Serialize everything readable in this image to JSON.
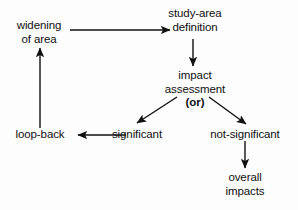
{
  "diagram": {
    "stroke_color": "#101010",
    "background_color": "#fdfdfd",
    "nodes": [
      {
        "id": "widening",
        "lines": [
          "widening",
          "of area"
        ]
      },
      {
        "id": "study_area",
        "lines": [
          "study-area",
          "definition"
        ]
      },
      {
        "id": "impact",
        "lines": [
          "impact",
          "assessment",
          "(or)"
        ]
      },
      {
        "id": "loop_back",
        "lines": [
          "loop-back"
        ]
      },
      {
        "id": "significant",
        "lines": [
          "significant"
        ]
      },
      {
        "id": "not_significant",
        "lines": [
          "not-significant"
        ]
      },
      {
        "id": "overall",
        "lines": [
          "overall",
          "impacts"
        ]
      }
    ],
    "edges": [
      {
        "id": "widening-to-study-area",
        "from": "widening",
        "to": "study_area",
        "kind": "horizontal-right"
      },
      {
        "id": "study-area-to-impact",
        "from": "study_area",
        "to": "impact",
        "kind": "vertical-down"
      },
      {
        "id": "impact-to-significant",
        "from": "impact",
        "to": "significant",
        "kind": "diagonal-down-left"
      },
      {
        "id": "impact-to-not-significant",
        "from": "impact",
        "to": "not_significant",
        "kind": "diagonal-down-right"
      },
      {
        "id": "significant-to-loop-back",
        "from": "significant",
        "to": "loop_back",
        "kind": "horizontal-left"
      },
      {
        "id": "loop-back-to-widening",
        "from": "loop_back",
        "to": "widening",
        "kind": "vertical-up"
      },
      {
        "id": "not-significant-to-overall",
        "from": "not_significant",
        "to": "overall",
        "kind": "vertical-down"
      }
    ]
  }
}
